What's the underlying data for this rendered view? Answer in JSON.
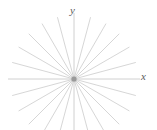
{
  "figure": {
    "title": "",
    "background_color": "#ffffff",
    "width": 157,
    "height": 130,
    "axis_labels": {
      "x": "x",
      "y": "y"
    },
    "label_color": "#5a5a5a"
  },
  "chart_data": {
    "type": "line",
    "title": "",
    "subtitle": "",
    "xlabel": "x",
    "ylabel": "y",
    "grid": false,
    "legend": null,
    "origin": {
      "x": 74,
      "y": 79
    },
    "xlim": [
      -74,
      83
    ],
    "ylim": [
      -51,
      79
    ],
    "ray_count": 24,
    "angle_step_degrees": 15,
    "ray_length": 64,
    "axis_ray_length": 66,
    "stroke_color": "#cccccc",
    "axis_stroke_color": "#c4c4c4",
    "stroke_width": 0.8,
    "center_dot": {
      "radius": 2.6,
      "color": "#9a9a9a"
    },
    "angles_degrees": [
      0,
      15,
      30,
      45,
      60,
      75,
      90,
      105,
      120,
      135,
      150,
      165,
      180,
      195,
      210,
      225,
      240,
      255,
      270,
      285,
      300,
      315,
      330,
      345
    ],
    "series": [
      {
        "name": "rays",
        "values": [
          64,
          64,
          64,
          64,
          64,
          64,
          64,
          64,
          64,
          64,
          64,
          64,
          64,
          64,
          64,
          64,
          64,
          64,
          64,
          64,
          64,
          64,
          64,
          64
        ]
      }
    ]
  }
}
